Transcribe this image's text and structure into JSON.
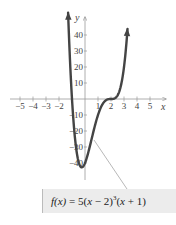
{
  "chart_data": {
    "type": "line",
    "title": "",
    "function": "f(x) = 5(x - 2)^3(x + 1)",
    "xlabel": "x",
    "ylabel": "y",
    "xlim": [
      -5.5,
      6
    ],
    "ylim": [
      -48,
      50
    ],
    "x_ticks": [
      -5,
      -4,
      -3,
      -2,
      1,
      2,
      3,
      4,
      5
    ],
    "x_tick_labels": [
      "−5",
      "−4",
      "−3",
      "−2",
      "1",
      "2",
      "3",
      "4",
      "5"
    ],
    "y_ticks": [
      40,
      30,
      20,
      10,
      -10,
      -20,
      -30,
      -40
    ],
    "y_tick_labels": [
      "40",
      "30",
      "20",
      "10",
      "−10",
      "−20",
      "−30",
      "−40"
    ],
    "series": [
      {
        "name": "f(x)",
        "x": [
          -1.3,
          -1.2,
          -1.1,
          -1.0,
          -0.75,
          -0.5,
          -0.25,
          0,
          0.5,
          1.0,
          1.5,
          2.0,
          2.5,
          3.0,
          3.2,
          3.27
        ],
        "values": [
          49.2,
          32.8,
          14.9,
          0,
          -17.8,
          -33.3,
          -42.7,
          -40,
          -42.2,
          -20,
          -3.1,
          0,
          2.2,
          20,
          36.3,
          49.0
        ]
      }
    ],
    "grid": false,
    "annotations": [
      {
        "text": "f(x) = 5(x − 2)³(x + 1)",
        "position": "bottom-right box with leader line to curve"
      }
    ]
  },
  "formula": {
    "lhs": "f(x)",
    "eq": " = 5(",
    "var1": "x",
    "part2": " − 2)",
    "exp": "3",
    "part3": "(",
    "var2": "x",
    "part4": " + 1)"
  },
  "axis": {
    "x_label": "x",
    "y_label": "y"
  }
}
